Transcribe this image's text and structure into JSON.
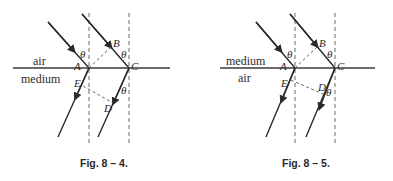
{
  "figures": [
    {
      "caption": "Fig. 8 – 4.",
      "upper_medium": "air",
      "lower_medium": "medium",
      "points": {
        "A": "A",
        "B": "B",
        "C": "C",
        "D": "D",
        "E": "E"
      },
      "angle_symbol": "θ"
    },
    {
      "caption": "Fig. 8 – 5.",
      "upper_medium": "medium",
      "lower_medium": "air",
      "points": {
        "A": "A",
        "B": "B",
        "C": "C",
        "D": "D",
        "E": "E"
      },
      "angle_symbol": "θ"
    }
  ],
  "colors": {
    "ink": "#2a2a2a",
    "background": "#ffffff"
  }
}
